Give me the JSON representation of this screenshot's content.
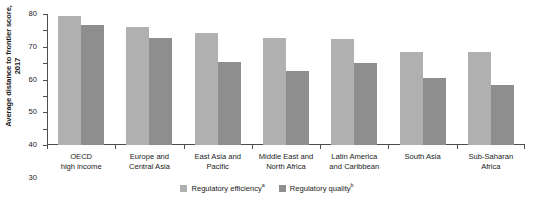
{
  "chart_data": {
    "type": "bar",
    "title": "",
    "xlabel": "",
    "ylabel": "Average distance to frontier score, 2017",
    "ylim": [
      0,
      80
    ],
    "yticks": [
      0,
      10,
      20,
      30,
      40,
      50,
      60,
      70,
      80
    ],
    "grid": false,
    "legend_position": "bottom-center",
    "categories": [
      "OECD\nhigh income",
      "Europe and\nCentral Asia",
      "East Asia and\nPacific",
      "Middle East and\nNorth Africa",
      "Latin America\nand Caribbean",
      "South Asia",
      "Sub-Saharan\nAfrica"
    ],
    "series": [
      {
        "name": "Regulatory efficiency",
        "note_marker": "a",
        "color": "#b0b0b0",
        "values": [
          79,
          72,
          68.5,
          65.5,
          64.5,
          56.5,
          56.5
        ]
      },
      {
        "name": "Regulatory quality",
        "note_marker": "b",
        "color": "#8e8e8e",
        "values": [
          73,
          65.5,
          51,
          45,
          50,
          41,
          36.5
        ]
      }
    ]
  },
  "colors": {
    "series_efficiency": "#b0b0b0",
    "series_quality": "#8e8e8e",
    "axis": "#4d4d4d",
    "text": "#1a1a1a",
    "background": "#ffffff"
  }
}
